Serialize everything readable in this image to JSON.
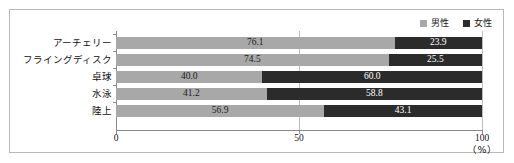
{
  "chart_data": {
    "type": "bar",
    "orientation": "horizontal",
    "stacked": true,
    "normalized_percent": true,
    "title": "",
    "xlabel": "",
    "ylabel": "",
    "unit": "（%）",
    "xlim": [
      0,
      100
    ],
    "xticks": [
      0,
      50,
      100
    ],
    "xticklabels": [
      "0",
      "50",
      "100"
    ],
    "grid": "vertical-at-50",
    "legend_position": "top-right",
    "categories": [
      "アーチェリー",
      "フライングディスク",
      "卓球",
      "水泳",
      "陸上"
    ],
    "series": [
      {
        "name": "男性",
        "color": "#a8a8a8",
        "values": [
          76.1,
          74.5,
          40.0,
          41.2,
          56.9
        ],
        "labels": [
          "76.1",
          "74.5",
          "40.0",
          "41.2",
          "56.9"
        ]
      },
      {
        "name": "女性",
        "color": "#2b2b2b",
        "values": [
          23.9,
          25.5,
          60.0,
          58.8,
          43.1
        ],
        "labels": [
          "23.9",
          "25.5",
          "60.0",
          "58.8",
          "43.1"
        ]
      }
    ]
  },
  "legend": {
    "entries": [
      {
        "label": "男性",
        "color": "#a8a8a8",
        "marker": "square-marker"
      },
      {
        "label": "女性",
        "color": "#2b2b2b",
        "marker": "square-marker"
      }
    ]
  },
  "axis": {
    "x_labels": [
      "0",
      "50",
      "100"
    ],
    "unit": "（%）"
  }
}
